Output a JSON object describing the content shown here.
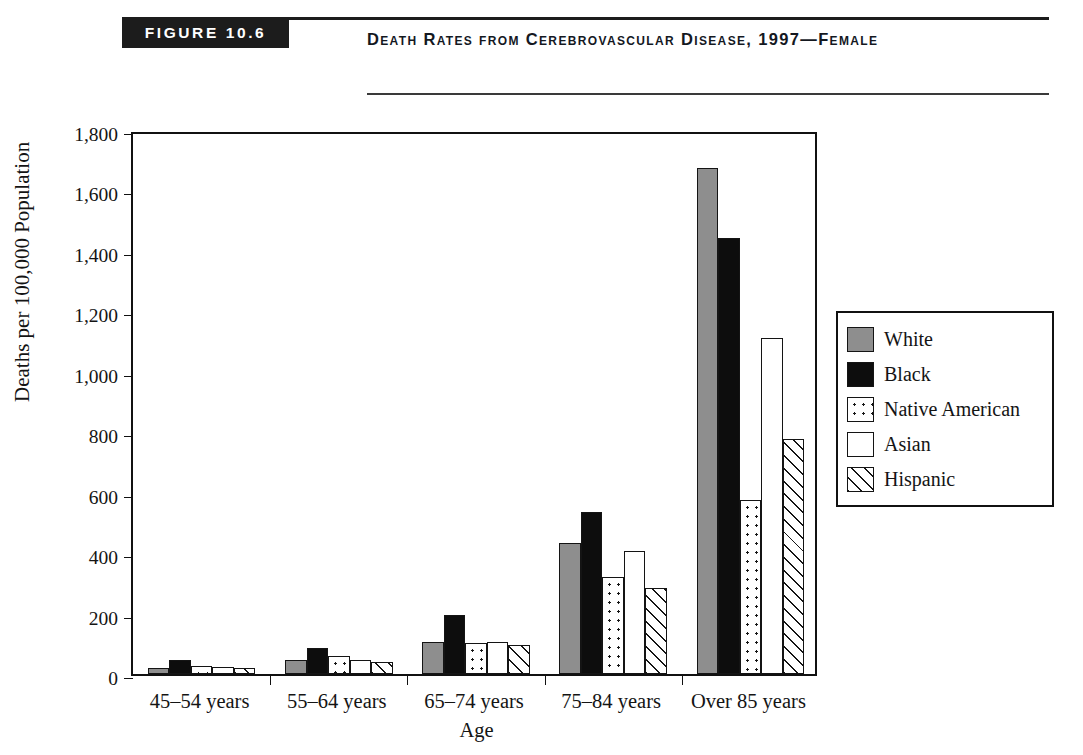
{
  "header": {
    "figure_badge": "FIGURE 10.6",
    "title": "Death Rates from Cerebrovascular Disease, 1997—Female"
  },
  "chart_data": {
    "type": "bar",
    "title": "Death Rates from Cerebrovascular Disease, 1997—Female",
    "xlabel": "Age",
    "ylabel": "Deaths per 100,000 Population",
    "ylim": [
      0,
      1800
    ],
    "ytick_labels": [
      "0",
      "200",
      "400",
      "600",
      "800",
      "1,000",
      "1,200",
      "1,400",
      "1,600",
      "1,800"
    ],
    "ytick_values": [
      0,
      200,
      400,
      600,
      800,
      1000,
      1200,
      1400,
      1600,
      1800
    ],
    "grid": false,
    "legend_position": "right",
    "categories": [
      "45–54 years",
      "55–64 years",
      "65–74 years",
      "75–84 years",
      "Over 85 years"
    ],
    "series": [
      {
        "name": "White",
        "pattern": "solid-gray",
        "color": "#8e8e8e",
        "values": [
          20,
          47,
          106,
          435,
          1675
        ]
      },
      {
        "name": "Black",
        "pattern": "solid-black",
        "color": "#0d0d0d",
        "values": [
          46,
          87,
          196,
          535,
          1443
        ]
      },
      {
        "name": "Native American",
        "pattern": "dotted",
        "color": "#ffffff",
        "values": [
          27,
          60,
          103,
          320,
          575
        ]
      },
      {
        "name": "Asian",
        "pattern": "white",
        "color": "#ffffff",
        "values": [
          23,
          47,
          106,
          408,
          1113
        ]
      },
      {
        "name": "Hispanic",
        "pattern": "hatch",
        "color": "#ffffff",
        "values": [
          20,
          40,
          96,
          283,
          778
        ]
      }
    ]
  }
}
